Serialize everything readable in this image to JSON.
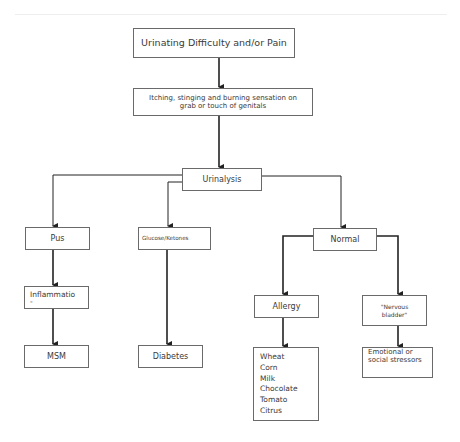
{
  "diagram": {
    "type": "flowchart",
    "nodes": {
      "root": "Urinating Difficulty and/or Pain",
      "symptom_line1": "Itching, stinging and burning sensation on",
      "symptom_line2": "grab or touch of genitals",
      "urinalysis": "Urinalysis",
      "pus": "Pus",
      "glucose": "Glucose/Ketones",
      "normal": "Normal",
      "inflammation_line1": "Inflammatio",
      "inflammation_line2": "-",
      "msm": "MSM",
      "diabetes": "Diabetes",
      "allergy": "Allergy",
      "nervous_line1": "\"Nervous",
      "nervous_line2": "bladder\"",
      "foods": [
        "Wheat",
        "Corn",
        "Milk",
        "Chocolate",
        "Tomato",
        "Citrus"
      ],
      "emotional_line1": "Emotional or",
      "emotional_line2": "social stressors"
    },
    "edges": [
      [
        "root",
        "symptom"
      ],
      [
        "symptom",
        "urinalysis"
      ],
      [
        "urinalysis",
        "pus"
      ],
      [
        "urinalysis",
        "glucose"
      ],
      [
        "urinalysis",
        "normal"
      ],
      [
        "pus",
        "inflammation"
      ],
      [
        "inflammation",
        "msm"
      ],
      [
        "glucose",
        "diabetes"
      ],
      [
        "normal",
        "allergy"
      ],
      [
        "normal",
        "nervous"
      ],
      [
        "allergy",
        "foods"
      ],
      [
        "nervous",
        "emotional"
      ]
    ]
  }
}
